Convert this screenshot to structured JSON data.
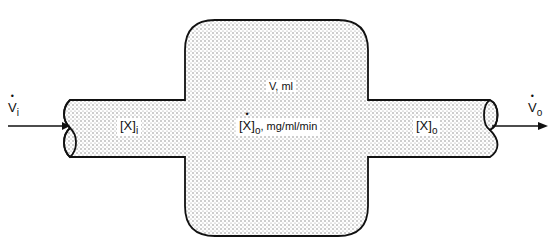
{
  "diagram": {
    "type": "single-compartment flow model",
    "inflow": {
      "label_symbol": "V",
      "label_sub": "i",
      "dotted": true
    },
    "outflow": {
      "label_symbol": "V",
      "label_sub": "o",
      "dotted": true
    },
    "inlet_pipe": {
      "label_symbol": "[X]",
      "label_sub": "i"
    },
    "outlet_pipe": {
      "label_symbol": "[X]",
      "label_sub": "o"
    },
    "tank": {
      "volume_label": "V, ml",
      "rate_symbol": "[X]",
      "rate_sub": "o",
      "rate_units": ", mg/ml/min"
    }
  },
  "colors": {
    "stroke": "#111111",
    "fill_stipple": "#c8c8c8",
    "background": "#ffffff"
  }
}
